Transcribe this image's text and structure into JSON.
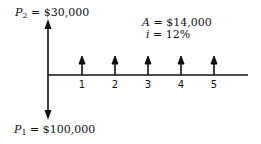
{
  "diagram": {
    "type": "cash-flow-diagram",
    "p2": {
      "symbol": "P",
      "sub": "2",
      "eq": " = ",
      "value": "$30,000"
    },
    "p1": {
      "symbol": "P",
      "sub": "1",
      "eq": " = ",
      "value": "$100,000"
    },
    "annuity": {
      "symbol": "A",
      "eq": " = ",
      "value": "$14,000"
    },
    "interest": {
      "symbol": "i",
      "eq": " = ",
      "value": "12%"
    },
    "periods": [
      "1",
      "2",
      "3",
      "4",
      "5"
    ],
    "colors": {
      "line": "#111111",
      "background": "#ffffff"
    }
  }
}
